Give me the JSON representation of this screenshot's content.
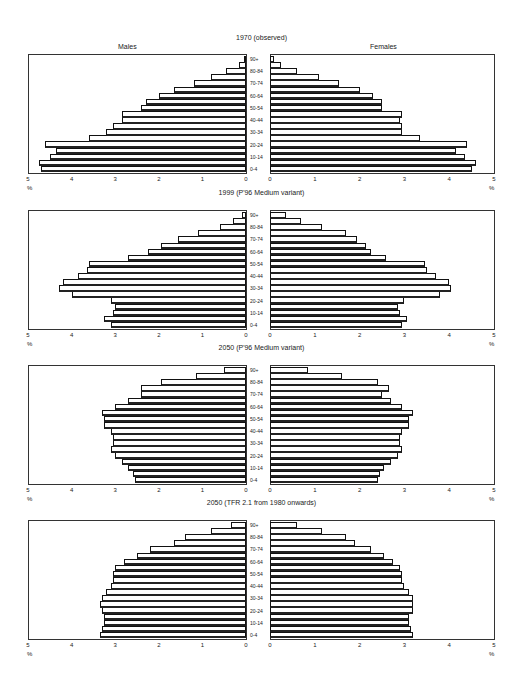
{
  "header": {
    "males_label": "Males",
    "females_label": "Females"
  },
  "axis": {
    "left_ticks": [
      "5",
      "4",
      "3",
      "2",
      "1",
      "0"
    ],
    "right_ticks": [
      "0",
      "1",
      "2",
      "3",
      "4",
      "5"
    ],
    "unit": "%"
  },
  "age_groups": [
    "0-4",
    "5-9",
    "10-14",
    "15-19",
    "20-24",
    "25-29",
    "30-34",
    "35-39",
    "40-44",
    "45-49",
    "50-54",
    "55-59",
    "60-64",
    "65-69",
    "70-74",
    "75-79",
    "80-84",
    "85-89",
    "90+"
  ],
  "age_labels_shown": [
    "90+",
    "80-84",
    "70-74",
    "60-64",
    "50-54",
    "40-44",
    "30-34",
    "20-24",
    "10-14",
    "0-4"
  ],
  "chart_data": [
    {
      "type": "bar",
      "title": "1970 (observed)",
      "xlabel": "%",
      "xlim": [
        0,
        5
      ],
      "categories": [
        "0-4",
        "5-9",
        "10-14",
        "15-19",
        "20-24",
        "25-29",
        "30-34",
        "35-39",
        "40-44",
        "45-49",
        "50-54",
        "55-59",
        "60-64",
        "65-69",
        "70-74",
        "75-79",
        "80-84",
        "85-89",
        "90+"
      ],
      "series": [
        {
          "name": "Males",
          "values": [
            4.7,
            4.75,
            4.5,
            4.35,
            4.6,
            3.6,
            3.2,
            3.05,
            2.85,
            2.85,
            2.4,
            2.3,
            2.0,
            1.65,
            1.2,
            0.8,
            0.45,
            0.15,
            0.05
          ]
        },
        {
          "name": "Females",
          "values": [
            4.5,
            4.6,
            4.35,
            4.15,
            4.4,
            3.35,
            2.95,
            2.95,
            2.9,
            2.95,
            2.5,
            2.5,
            2.3,
            2.0,
            1.55,
            1.1,
            0.6,
            0.25,
            0.08
          ]
        }
      ]
    },
    {
      "type": "bar",
      "title": "1999 (P'96 Medium variant)",
      "xlabel": "%",
      "xlim": [
        0,
        5
      ],
      "categories": [
        "0-4",
        "5-9",
        "10-14",
        "15-19",
        "20-24",
        "25-29",
        "30-34",
        "35-39",
        "40-44",
        "45-49",
        "50-54",
        "55-59",
        "60-64",
        "65-69",
        "70-74",
        "75-79",
        "80-84",
        "85-89",
        "90+"
      ],
      "series": [
        {
          "name": "Males",
          "values": [
            3.1,
            3.25,
            3.05,
            3.0,
            3.1,
            4.0,
            4.3,
            4.2,
            3.85,
            3.65,
            3.6,
            2.7,
            2.25,
            1.95,
            1.55,
            1.1,
            0.6,
            0.3,
            0.1
          ]
        },
        {
          "name": "Females",
          "values": [
            2.95,
            3.05,
            2.9,
            2.85,
            3.0,
            3.8,
            4.05,
            4.0,
            3.7,
            3.5,
            3.45,
            2.6,
            2.25,
            2.15,
            1.95,
            1.7,
            1.15,
            0.7,
            0.35
          ]
        }
      ]
    },
    {
      "type": "bar",
      "title": "2050 (P'96 Medium variant)",
      "xlabel": "%",
      "xlim": [
        0,
        5
      ],
      "categories": [
        "0-4",
        "5-9",
        "10-14",
        "15-19",
        "20-24",
        "25-29",
        "30-34",
        "35-39",
        "40-44",
        "45-49",
        "50-54",
        "55-59",
        "60-64",
        "65-69",
        "70-74",
        "75-79",
        "80-84",
        "85-89",
        "90+"
      ],
      "series": [
        {
          "name": "Males",
          "values": [
            2.55,
            2.6,
            2.7,
            2.85,
            3.0,
            3.1,
            3.05,
            3.05,
            3.1,
            3.25,
            3.25,
            3.3,
            3.0,
            2.7,
            2.4,
            2.4,
            1.95,
            1.15,
            0.5
          ]
        },
        {
          "name": "Females",
          "values": [
            2.4,
            2.45,
            2.55,
            2.7,
            2.85,
            2.95,
            2.9,
            2.9,
            2.95,
            3.1,
            3.1,
            3.2,
            2.95,
            2.7,
            2.5,
            2.65,
            2.4,
            1.6,
            0.85
          ]
        }
      ]
    },
    {
      "type": "bar",
      "title": "2050 (TFR 2.1 from 1980 onwards)",
      "xlabel": "%",
      "xlim": [
        0,
        5
      ],
      "categories": [
        "0-4",
        "5-9",
        "10-14",
        "15-19",
        "20-24",
        "25-29",
        "30-34",
        "35-39",
        "40-44",
        "45-49",
        "50-54",
        "55-59",
        "60-64",
        "65-69",
        "70-74",
        "75-79",
        "80-84",
        "85-89",
        "90+"
      ],
      "series": [
        {
          "name": "Males",
          "values": [
            3.35,
            3.3,
            3.25,
            3.25,
            3.3,
            3.35,
            3.3,
            3.2,
            3.1,
            3.05,
            3.05,
            3.0,
            2.8,
            2.5,
            2.2,
            1.65,
            1.4,
            0.8,
            0.35
          ]
        },
        {
          "name": "Females",
          "values": [
            3.2,
            3.15,
            3.1,
            3.1,
            3.2,
            3.2,
            3.2,
            3.1,
            3.0,
            2.95,
            2.95,
            2.9,
            2.75,
            2.55,
            2.25,
            1.9,
            1.7,
            1.15,
            0.6
          ]
        }
      ]
    }
  ]
}
